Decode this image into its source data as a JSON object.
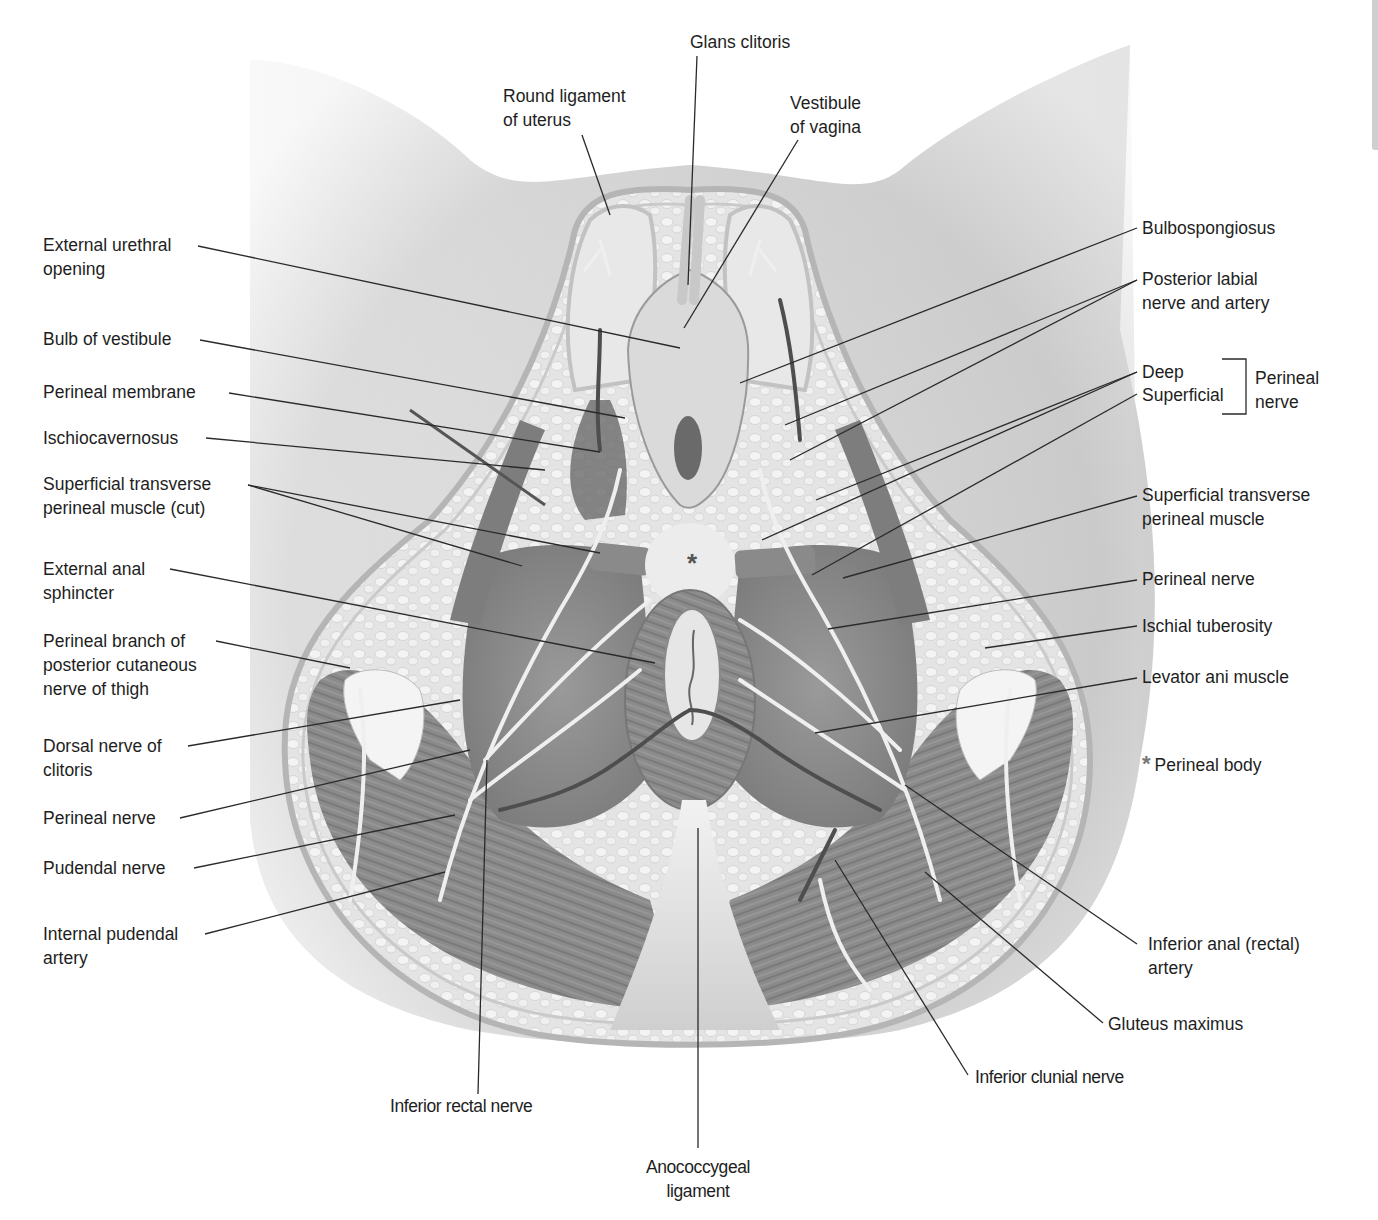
{
  "figure": {
    "colors": {
      "skin_shading": "#bdbdbd",
      "muscle": "#8f8f8f",
      "muscle_dark": "#6e6e6e",
      "fat": "#e6e6e6",
      "nerve": "#efefef",
      "artery": "#555555",
      "leader_line": "#2a2a2a",
      "perineal_body_star": "#777777"
    },
    "labels": {
      "top": [
        {
          "id": "glans-clitoris",
          "text": "Glans clitoris"
        },
        {
          "id": "round-ligament",
          "text": "Round ligament\nof uterus"
        },
        {
          "id": "vestibule-vagina",
          "text": "Vestibule\nof vagina"
        }
      ],
      "left": [
        {
          "id": "external-urethral-opening",
          "text": "External urethral\nopening"
        },
        {
          "id": "bulb-of-vestibule",
          "text": "Bulb of vestibule"
        },
        {
          "id": "perineal-membrane",
          "text": "Perineal membrane"
        },
        {
          "id": "ischiocavernosus",
          "text": "Ischiocavernosus"
        },
        {
          "id": "superficial-transverse-perineal-cut",
          "text": "Superficial transverse\nperineal muscle (cut)"
        },
        {
          "id": "external-anal-sphincter",
          "text": "External anal\nsphincter"
        },
        {
          "id": "perineal-branch-post-cutaneous",
          "text": "Perineal branch of\nposterior cutaneous\nnerve of thigh"
        },
        {
          "id": "dorsal-nerve-clitoris",
          "text": "Dorsal nerve of\nclitoris"
        },
        {
          "id": "perineal-nerve-left",
          "text": "Perineal nerve"
        },
        {
          "id": "pudendal-nerve",
          "text": "Pudendal nerve"
        },
        {
          "id": "internal-pudendal-artery",
          "text": "Internal pudendal\nartery"
        }
      ],
      "right": [
        {
          "id": "bulbospongiosus",
          "text": "Bulbospongiosus"
        },
        {
          "id": "posterior-labial",
          "text": "Posterior labial\nnerve and artery"
        },
        {
          "id": "deep",
          "text": "Deep"
        },
        {
          "id": "superficial",
          "text": "Superficial"
        },
        {
          "id": "perineal-nerve-group",
          "text": "Perineal\nnerve"
        },
        {
          "id": "superficial-transverse-perineal",
          "text": "Superficial transverse\nperineal muscle"
        },
        {
          "id": "perineal-nerve-right",
          "text": "Perineal nerve"
        },
        {
          "id": "ischial-tuberosity",
          "text": "Ischial tuberosity"
        },
        {
          "id": "levator-ani",
          "text": "Levator ani muscle"
        },
        {
          "id": "inferior-anal-artery",
          "text": "Inferior anal (rectal)\nartery"
        },
        {
          "id": "gluteus-maximus",
          "text": "Gluteus maximus"
        }
      ],
      "bottom": [
        {
          "id": "inferior-rectal-nerve",
          "text": "Inferior rectal nerve"
        },
        {
          "id": "anococcygeal-ligament",
          "text": "Anococcygeal\nligament"
        },
        {
          "id": "inferior-clunial-nerve",
          "text": "Inferior clunial nerve"
        }
      ]
    },
    "legend": {
      "symbol": "*",
      "text": "Perineal body"
    },
    "center_marker": "*"
  }
}
